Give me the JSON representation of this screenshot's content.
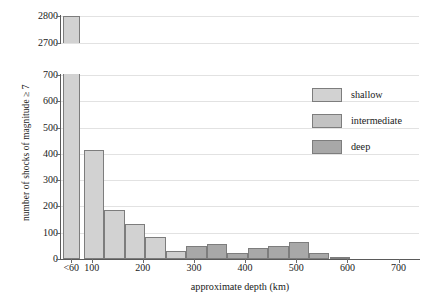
{
  "chart_data": {
    "type": "bar",
    "title": "",
    "xlabel": "approximate depth (km)",
    "ylabel": "number of shocks of magnitude ≥ 7",
    "xlim": [
      40,
      740
    ],
    "ylim_lower": [
      0,
      725
    ],
    "ylim_upper": [
      2680,
      2810
    ],
    "axis_break": true,
    "grid": true,
    "legend_position": "upper right",
    "ytick_labels_lower": [
      "0",
      "100",
      "200",
      "300",
      "400",
      "500",
      "600",
      "700"
    ],
    "ytick_values_lower": [
      0,
      100,
      200,
      300,
      400,
      500,
      600,
      700
    ],
    "ytick_labels_upper": [
      "2700",
      "2800"
    ],
    "ytick_values_upper": [
      2700,
      2800
    ],
    "xtick_labels": [
      "<60",
      "100",
      "200",
      "300",
      "400",
      "500",
      "600",
      "700"
    ],
    "xtick_values": [
      60,
      100,
      200,
      300,
      400,
      500,
      600,
      700
    ],
    "legend": [
      {
        "label": "shallow",
        "color": "#d2d2d2"
      },
      {
        "label": "intermediate",
        "color": "#c2c2c2"
      },
      {
        "label": "deep",
        "color": "#a8a8a8"
      }
    ],
    "bars": [
      {
        "x0": 44,
        "x1": 78,
        "value": 2816,
        "class": "shallow",
        "color": "#d2d2d2",
        "clipped": true
      },
      {
        "x0": 85,
        "x1": 125,
        "value": 415,
        "class": "shallow",
        "color": "#d2d2d2",
        "clipped": false
      },
      {
        "x0": 125,
        "x1": 165,
        "value": 187,
        "class": "shallow",
        "color": "#d2d2d2",
        "clipped": false
      },
      {
        "x0": 165,
        "x1": 205,
        "value": 133,
        "class": "shallow",
        "color": "#d2d2d2",
        "clipped": false
      },
      {
        "x0": 205,
        "x1": 245,
        "value": 85,
        "class": "shallow",
        "color": "#d2d2d2",
        "clipped": false
      },
      {
        "x0": 245,
        "x1": 285,
        "value": 30,
        "class": "intermediate",
        "color": "#cfcfcf",
        "clipped": false
      },
      {
        "x0": 285,
        "x1": 325,
        "value": 48,
        "class": "deep",
        "color": "#a8a8a8",
        "clipped": false
      },
      {
        "x0": 325,
        "x1": 365,
        "value": 58,
        "class": "deep",
        "color": "#a8a8a8",
        "clipped": false
      },
      {
        "x0": 365,
        "x1": 405,
        "value": 22,
        "class": "deep",
        "color": "#a8a8a8",
        "clipped": false
      },
      {
        "x0": 405,
        "x1": 445,
        "value": 43,
        "class": "deep",
        "color": "#a8a8a8",
        "clipped": false
      },
      {
        "x0": 445,
        "x1": 485,
        "value": 48,
        "class": "deep",
        "color": "#a8a8a8",
        "clipped": false
      },
      {
        "x0": 485,
        "x1": 525,
        "value": 65,
        "class": "deep",
        "color": "#a8a8a8",
        "clipped": false
      },
      {
        "x0": 525,
        "x1": 565,
        "value": 22,
        "class": "deep",
        "color": "#a8a8a8",
        "clipped": false
      },
      {
        "x0": 565,
        "x1": 605,
        "value": 5,
        "class": "deep",
        "color": "#a8a8a8",
        "clipped": false
      }
    ],
    "upper_bar": {
      "x0": 44,
      "x1": 78,
      "top": 2800,
      "bottom": 2680,
      "color": "#d2d2d2"
    }
  }
}
